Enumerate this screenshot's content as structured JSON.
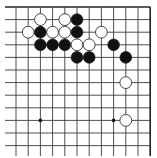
{
  "board": {
    "view": "top-right corner",
    "columns": 12,
    "rows": 12,
    "origin_x": 16,
    "origin_y": 7,
    "spacing_x": 12.2,
    "spacing_y": 12.6,
    "stub_left": 5,
    "stub_bottom": 156,
    "stone_radius": 5.9,
    "edges": [
      "top",
      "right"
    ],
    "colors": {
      "black": "#111111",
      "white": "#ffffff",
      "line": "#3a3a3a"
    }
  },
  "star_points": [
    {
      "col": 2,
      "row": 9
    },
    {
      "col": 8,
      "row": 9
    }
  ],
  "stones": [
    {
      "color": "white",
      "col": 2,
      "row": 1
    },
    {
      "color": "white",
      "col": 4,
      "row": 1
    },
    {
      "color": "black",
      "col": 5,
      "row": 1
    },
    {
      "color": "white",
      "col": 1,
      "row": 2
    },
    {
      "color": "black",
      "col": 2,
      "row": 2
    },
    {
      "color": "white",
      "col": 3,
      "row": 2
    },
    {
      "color": "white",
      "col": 4,
      "row": 2
    },
    {
      "color": "black",
      "col": 5,
      "row": 2
    },
    {
      "color": "white",
      "col": 7,
      "row": 2
    },
    {
      "color": "black",
      "col": 2,
      "row": 3
    },
    {
      "color": "black",
      "col": 3,
      "row": 3
    },
    {
      "color": "black",
      "col": 4,
      "row": 3
    },
    {
      "color": "white",
      "col": 5,
      "row": 3
    },
    {
      "color": "white",
      "col": 6,
      "row": 3
    },
    {
      "color": "black",
      "col": 8,
      "row": 3
    },
    {
      "color": "black",
      "col": 5,
      "row": 4
    },
    {
      "color": "black",
      "col": 6,
      "row": 4
    },
    {
      "color": "black",
      "col": 9,
      "row": 4
    },
    {
      "color": "white",
      "col": 9,
      "row": 6
    },
    {
      "color": "white",
      "col": 9,
      "row": 9
    }
  ]
}
